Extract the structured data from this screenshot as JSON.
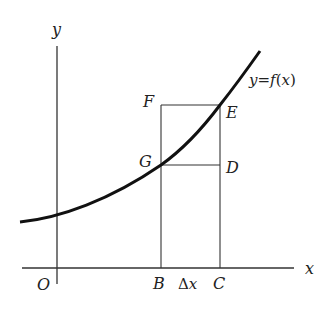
{
  "diagram": {
    "axes": {
      "x_label": "x",
      "y_label": "y",
      "origin_label": "O"
    },
    "curve": {
      "label": "y = f(x)",
      "label_parts": {
        "y": "y",
        "eq": "=",
        "f": "f",
        "open": "(",
        "x": "x",
        "close": ")"
      }
    },
    "points": {
      "B": "B",
      "C": "C",
      "D": "D",
      "E": "E",
      "F": "F",
      "G": "G"
    },
    "delta_label": {
      "delta": "Δ",
      "x": "x"
    },
    "colors": {
      "ink": "#222222",
      "background": "#ffffff"
    }
  }
}
